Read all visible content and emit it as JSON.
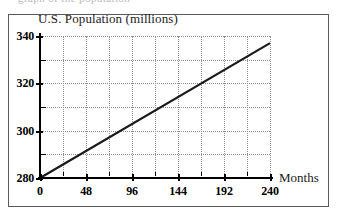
{
  "figure": {
    "title": "U.S. Population (millions)",
    "x_axis_name": "Months",
    "scan_artifact_text": "graph  of  the  population",
    "border_color": "#5a5a5a",
    "grid_color": "#8e8e8e",
    "axis_color": "#000000",
    "line_color": "#1a1a1a"
  },
  "chart_data": {
    "type": "line",
    "title": "U.S. Population (millions)",
    "xlabel": "Months",
    "ylabel": "U.S. Population (millions)",
    "xlim": [
      0,
      240
    ],
    "ylim": [
      280,
      340
    ],
    "grid": true,
    "legend": "none",
    "x_major_ticks": [
      0,
      48,
      96,
      144,
      192,
      240
    ],
    "x_minor_ticks": [
      24,
      72,
      120,
      168,
      216
    ],
    "x_tick_labels": [
      "0",
      "48",
      "96",
      "144",
      "192",
      "240"
    ],
    "y_major_ticks": [
      280,
      300,
      320,
      340
    ],
    "y_minor_ticks": [
      290,
      310,
      330
    ],
    "y_tick_labels": [
      "280",
      "300",
      "320",
      "340"
    ],
    "x_gridlines": [
      24,
      48,
      72,
      96,
      120,
      144,
      168,
      192,
      216,
      240
    ],
    "y_gridlines": [
      290,
      300,
      310,
      320,
      330,
      340
    ],
    "series": [
      {
        "name": "U.S. Population",
        "x": [
          0,
          240
        ],
        "values": [
          280,
          337
        ],
        "slope_per_month": 0.2375,
        "intercept": 280
      }
    ]
  }
}
